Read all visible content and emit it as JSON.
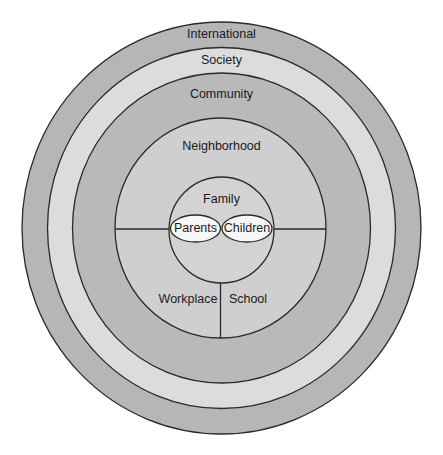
{
  "diagram": {
    "type": "concentric-ecological-model",
    "rings": [
      {
        "key": "international",
        "label": "International",
        "color": "#b6b6b6"
      },
      {
        "key": "society",
        "label": "Society",
        "color": "#dcdcdc"
      },
      {
        "key": "community",
        "label": "Community",
        "color": "#b9b9b9"
      },
      {
        "key": "neighborhood",
        "label": "Neighborhood",
        "color": "#cfcfcf"
      },
      {
        "key": "family",
        "label": "Family",
        "color": "#d3d3d3"
      }
    ],
    "family_members": [
      {
        "key": "parents",
        "label": "Parents",
        "color": "#f7f7f7"
      },
      {
        "key": "children",
        "label": "Children",
        "color": "#f7f7f7"
      }
    ],
    "neighborhood_sections": [
      {
        "key": "workplace",
        "label": "Workplace"
      },
      {
        "key": "school",
        "label": "School"
      }
    ],
    "stroke_color": "#2a2a2a"
  }
}
